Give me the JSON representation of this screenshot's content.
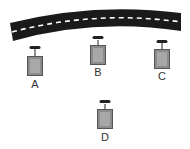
{
  "diagram": {
    "road": {
      "color": "#1a1a1a",
      "lane_marking_color": "#ffffff"
    },
    "towers": [
      {
        "id": "A",
        "label": "A"
      },
      {
        "id": "B",
        "label": "B"
      },
      {
        "id": "C",
        "label": "C"
      },
      {
        "id": "D",
        "label": "D"
      }
    ],
    "colors": {
      "tower_fill": "#8c8c8c",
      "tower_inner": "#a8a8a8",
      "tower_border": "#555555",
      "antenna": "#222222"
    }
  }
}
